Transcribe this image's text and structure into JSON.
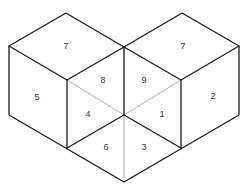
{
  "diagram": {
    "title": "",
    "colors": {
      "edge": "#1a1a1a",
      "thin_line": "#9a9a9a",
      "text": "#333333",
      "background": "#ffffff"
    },
    "faces": [
      {
        "id": "left-cube-top",
        "label": "7",
        "x": 66,
        "y": 47
      },
      {
        "id": "left-cube-left",
        "label": "5",
        "x": 37,
        "y": 98
      },
      {
        "id": "left-inner-upper",
        "label": "8",
        "x": 103,
        "y": 81
      },
      {
        "id": "left-inner-lower",
        "label": "4",
        "x": 88,
        "y": 115
      },
      {
        "id": "right-cube-top",
        "label": "7",
        "x": 183,
        "y": 47
      },
      {
        "id": "right-cube-right",
        "label": "2",
        "x": 213,
        "y": 97
      },
      {
        "id": "right-inner-upper",
        "label": "9",
        "x": 144,
        "y": 81
      },
      {
        "id": "right-inner-lower",
        "label": "1",
        "x": 162,
        "y": 115
      },
      {
        "id": "bottom-left",
        "label": "6",
        "x": 106,
        "y": 148
      },
      {
        "id": "bottom-right",
        "label": "3",
        "x": 144,
        "y": 148
      }
    ]
  }
}
